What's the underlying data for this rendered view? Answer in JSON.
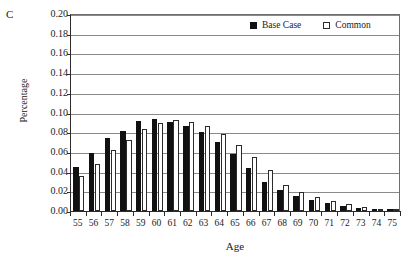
{
  "panel": {
    "label": "C"
  },
  "legend": {
    "position": "top-right",
    "items": [
      {
        "name": "Base Case",
        "swatch": "filled-square-black",
        "color": "#111111"
      },
      {
        "name": "Common",
        "swatch": "open-square-white",
        "color": "#ffffff"
      }
    ]
  },
  "axes": {
    "y_title": "Percentage",
    "x_title": "Age",
    "y_ticks": [
      "0.00",
      "0.02",
      "0.04",
      "0.06",
      "0.08",
      "0.10",
      "0.12",
      "0.14",
      "0.16",
      "0.18",
      "0.20"
    ]
  },
  "chart_data": {
    "type": "bar",
    "title": "C",
    "xlabel": "Age",
    "ylabel": "Percentage",
    "ylim": [
      0.0,
      0.2
    ],
    "ytick_step": 0.02,
    "grid": true,
    "legend_position": "top-right",
    "categories": [
      "55",
      "56",
      "57",
      "58",
      "59",
      "60",
      "61",
      "62",
      "63",
      "64",
      "65",
      "66",
      "67",
      "68",
      "69",
      "70",
      "71",
      "72",
      "73",
      "74",
      "75"
    ],
    "series": [
      {
        "name": "Base Case",
        "color": "#111111",
        "values": [
          0.045,
          0.059,
          0.074,
          0.081,
          0.091,
          0.093,
          0.09,
          0.086,
          0.08,
          0.07,
          0.058,
          0.044,
          0.029,
          0.021,
          0.015,
          0.011,
          0.008,
          0.005,
          0.003,
          0.002,
          0.001
        ]
      },
      {
        "name": "Common",
        "color": "#ffffff",
        "values": [
          0.036,
          0.048,
          0.062,
          0.072,
          0.083,
          0.089,
          0.092,
          0.09,
          0.086,
          0.078,
          0.067,
          0.055,
          0.042,
          0.026,
          0.019,
          0.014,
          0.01,
          0.007,
          0.004,
          0.002,
          0.001
        ]
      }
    ]
  }
}
